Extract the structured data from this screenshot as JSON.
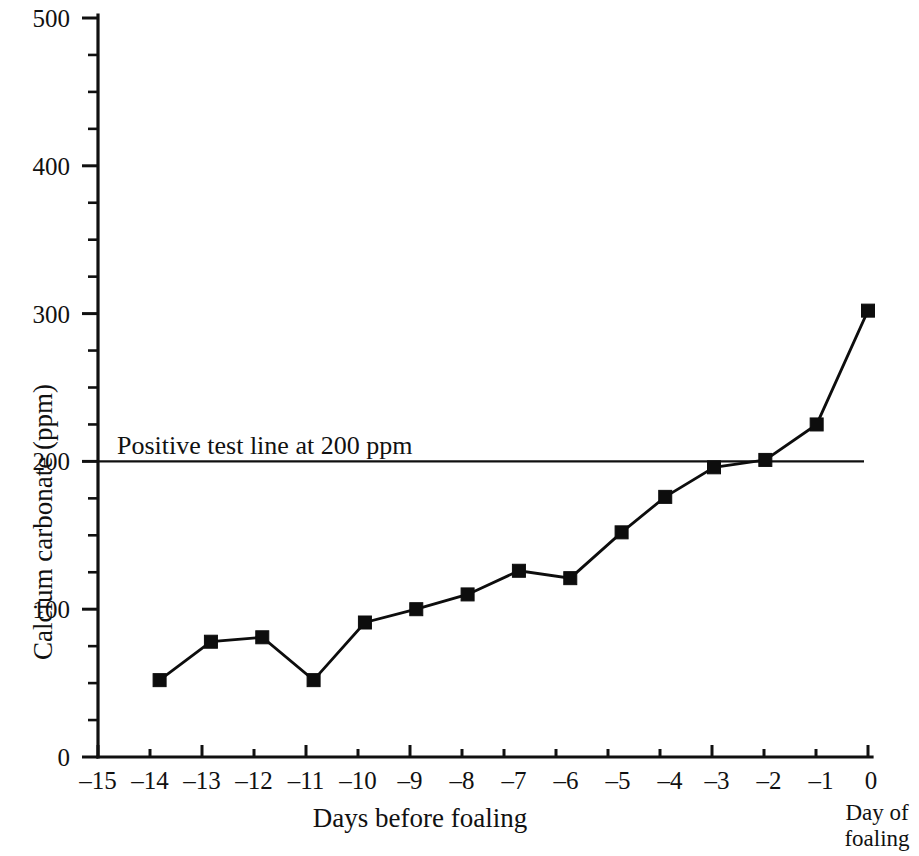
{
  "chart_data": {
    "type": "line",
    "title": "",
    "xlabel": "Days before foaling",
    "ylabel": "Calcium carbonate (ppm)",
    "xlim": [
      -15,
      0
    ],
    "ylim": [
      0,
      500
    ],
    "grid": false,
    "legend": "none",
    "x_ticks": [
      -15,
      -14,
      -13,
      -12,
      -11,
      -10,
      -9,
      -8,
      -7,
      -6,
      -5,
      -4,
      -3,
      -2,
      -1,
      0
    ],
    "x_tick_labels": [
      "–15",
      "–14",
      "–13",
      "–12",
      "–11",
      "–10",
      "–9",
      "–8",
      "–7",
      "–6",
      "–5",
      "–4",
      "–3",
      "–2",
      "–1",
      "0"
    ],
    "y_ticks": [
      0,
      100,
      200,
      300,
      400,
      500
    ],
    "y_tick_labels": [
      "0",
      "100",
      "200",
      "300",
      "400",
      "500"
    ],
    "y_minor_step": 25,
    "marker": "filled-square",
    "series": [
      {
        "name": "Calcium carbonate",
        "x": [
          -13.8,
          -12.8,
          -11.8,
          -10.8,
          -9.8,
          -8.8,
          -7.8,
          -6.8,
          -5.8,
          -4.8,
          -3.95,
          -3.0,
          -2.0,
          -1.0,
          0.0
        ],
        "values": [
          52,
          78,
          81,
          52,
          91,
          100,
          110,
          126,
          121,
          152,
          176,
          196,
          201,
          225,
          302
        ]
      }
    ],
    "threshold": {
      "label": "Positive test line at 200 ppm",
      "value": 200,
      "x_start": -15,
      "x_end": 0
    },
    "annotations": [
      {
        "name": "day-of-foaling-note",
        "text_line_1": "Day of",
        "text_line_2": "foaling",
        "at_x": 0
      }
    ]
  }
}
